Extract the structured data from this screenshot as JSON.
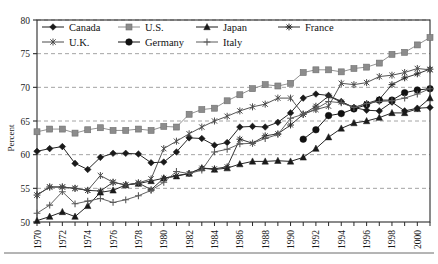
{
  "chart_data": {
    "type": "line",
    "title": "",
    "xlabel": "",
    "ylabel": "Percent",
    "ylim": [
      50,
      80
    ],
    "xlim": [
      1970,
      2001
    ],
    "ytick_step": 5,
    "yticks": [
      50,
      55,
      60,
      65,
      70,
      75,
      80
    ],
    "xticks": [
      1970,
      1972,
      1974,
      1976,
      1978,
      1980,
      1982,
      1984,
      1986,
      1988,
      1990,
      1992,
      1994,
      1996,
      1998,
      2000
    ],
    "xtick_minor_step": 1,
    "grid": "horizontal-dashed",
    "legend_position": "top-inside",
    "x": [
      1970,
      1971,
      1972,
      1973,
      1974,
      1975,
      1976,
      1977,
      1978,
      1979,
      1980,
      1981,
      1982,
      1983,
      1984,
      1985,
      1986,
      1987,
      1988,
      1989,
      1990,
      1991,
      1992,
      1993,
      1994,
      1995,
      1996,
      1997,
      1998,
      1999,
      2000,
      2001
    ],
    "series": [
      {
        "name": "Canada",
        "marker": "diamond",
        "color": "#1a1a1a",
        "values": [
          60.5,
          60.9,
          61.2,
          58.7,
          57.8,
          59.6,
          60.2,
          60.2,
          60.1,
          58.8,
          58.9,
          60.4,
          62.5,
          62.4,
          61.4,
          61.8,
          64.1,
          64.2,
          64.1,
          64.8,
          66.2,
          68.4,
          69.0,
          68.8,
          67.9,
          67.0,
          66.6,
          66.5,
          67.8,
          66.5,
          66.9,
          67.0
        ]
      },
      {
        "name": "U.S.",
        "marker": "square",
        "color": "#8c8c8c",
        "values": [
          63.4,
          63.8,
          63.8,
          63.2,
          63.7,
          64.0,
          63.6,
          63.6,
          63.8,
          63.6,
          64.2,
          64.1,
          66.0,
          66.7,
          66.9,
          68.0,
          68.9,
          69.8,
          70.4,
          70.2,
          70.6,
          72.2,
          72.6,
          72.6,
          72.3,
          72.8,
          73.0,
          73.6,
          74.9,
          75.2,
          76.3,
          77.4
        ]
      },
      {
        "name": "Japan",
        "marker": "triangle",
        "color": "#1a1a1a",
        "values": [
          50.2,
          50.8,
          51.5,
          50.8,
          52.4,
          54.4,
          54.7,
          55.5,
          55.7,
          56.1,
          56.5,
          56.8,
          57.2,
          58.0,
          57.8,
          58.0,
          58.6,
          59.0,
          59.0,
          59.1,
          59.0,
          59.6,
          60.9,
          62.6,
          63.9,
          64.7,
          65.0,
          65.5,
          66.2,
          66.2,
          66.8,
          68.4
        ]
      },
      {
        "name": "France",
        "marker": "asterisk",
        "color": "#2b2b2b",
        "values": [
          54.0,
          55.2,
          55.2,
          55.0,
          54.7,
          54.6,
          55.9,
          55.5,
          55.8,
          54.8,
          56.5,
          56.9,
          57.2,
          58.0,
          57.9,
          58.2,
          62.3,
          61.7,
          62.8,
          63.1,
          64.4,
          66.0,
          67.2,
          68.7,
          67.8,
          67.0,
          67.6,
          68.2,
          70.4,
          71.4,
          72.0,
          72.7
        ]
      },
      {
        "name": "U.K.",
        "marker": "x-star",
        "color": "#4a4a4a",
        "values": [
          54.0,
          55.2,
          55.2,
          55.0,
          54.7,
          56.9,
          55.9,
          55.5,
          55.8,
          56.4,
          60.9,
          62.0,
          63.1,
          64.1,
          65.0,
          65.7,
          66.5,
          67.1,
          67.5,
          68.4,
          68.4,
          66.0,
          66.7,
          67.2,
          70.6,
          70.4,
          70.7,
          71.6,
          71.8,
          72.2,
          72.8,
          72.6
        ]
      },
      {
        "name": "Germany",
        "marker": "circle",
        "color": "#111111",
        "values": [
          null,
          null,
          null,
          null,
          null,
          null,
          null,
          null,
          null,
          null,
          null,
          null,
          null,
          null,
          null,
          null,
          null,
          null,
          null,
          null,
          null,
          62.3,
          63.7,
          65.8,
          66.1,
          66.8,
          67.4,
          68.1,
          68.1,
          69.2,
          69.6,
          69.8
        ]
      },
      {
        "name": "Italy",
        "marker": "plus",
        "color": "#5a5a5a",
        "values": [
          51.3,
          52.5,
          54.5,
          52.7,
          53.1,
          53.5,
          52.9,
          53.3,
          53.9,
          54.7,
          55.9,
          57.5,
          57.2,
          57.7,
          60.4,
          60.8,
          61.6,
          61.7,
          62.4,
          63.0,
          65.4,
          66.0,
          66.8,
          67.9,
          67.7,
          67.0,
          67.6,
          67.9,
          68.0,
          68.4,
          69.0,
          69.8
        ]
      }
    ]
  },
  "legend": {
    "entries": [
      {
        "label": "Canada"
      },
      {
        "label": "U.S."
      },
      {
        "label": "Japan"
      },
      {
        "label": "France"
      },
      {
        "label": "U.K."
      },
      {
        "label": "Germany"
      },
      {
        "label": "Italy"
      }
    ]
  }
}
